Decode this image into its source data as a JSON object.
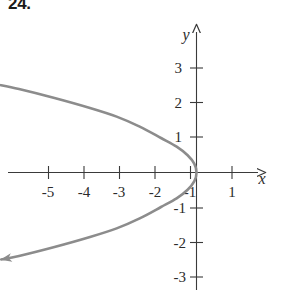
{
  "problem": {
    "number": "24."
  },
  "chart_data": {
    "type": "line",
    "title": "",
    "subtitle": "",
    "xlabel": "x",
    "ylabel": "y",
    "xlim": [
      -6.1,
      2.1
    ],
    "ylim": [
      -3.6,
      3.6
    ],
    "grid": false,
    "legend": null,
    "axis_style": "arrowed-cartesian-axes",
    "xticks": [
      -5,
      -4,
      -3,
      -2,
      -1,
      1
    ],
    "xtick_labels": [
      "-5",
      "-4",
      "-3",
      "-2",
      "-1",
      "1"
    ],
    "yticks": [
      3,
      2,
      1,
      -1,
      -2,
      -3
    ],
    "ytick_labels": [
      "3",
      "2",
      "1",
      "-1",
      "-2",
      "-3"
    ],
    "curve_color": "#8c8c8c",
    "axis_color": "#3a3a3a",
    "series": [
      {
        "name": "x = -y^2",
        "equation": "x = -y^2",
        "description": "leftward-opening parabola, vertex at origin, arrowheads at both ends",
        "arrowheads": [
          "start",
          "end"
        ],
        "points": [
          [
            -5.6,
            2.55
          ],
          [
            -5.0,
            2.42
          ],
          [
            -4.0,
            2.16
          ],
          [
            -3.0,
            1.87
          ],
          [
            -2.25,
            1.62
          ],
          [
            -1.6,
            1.33
          ],
          [
            -1.0,
            1.0
          ],
          [
            -0.56,
            0.75
          ],
          [
            -0.25,
            0.5
          ],
          [
            -0.06,
            0.25
          ],
          [
            0.0,
            0.0
          ],
          [
            -0.06,
            -0.25
          ],
          [
            -0.25,
            -0.5
          ],
          [
            -0.56,
            -0.75
          ],
          [
            -1.0,
            -1.0
          ],
          [
            -1.6,
            -1.33
          ],
          [
            -2.25,
            -1.62
          ],
          [
            -3.0,
            -1.87
          ],
          [
            -4.0,
            -2.16
          ],
          [
            -5.0,
            -2.42
          ],
          [
            -5.5,
            -2.52
          ]
        ]
      }
    ]
  }
}
